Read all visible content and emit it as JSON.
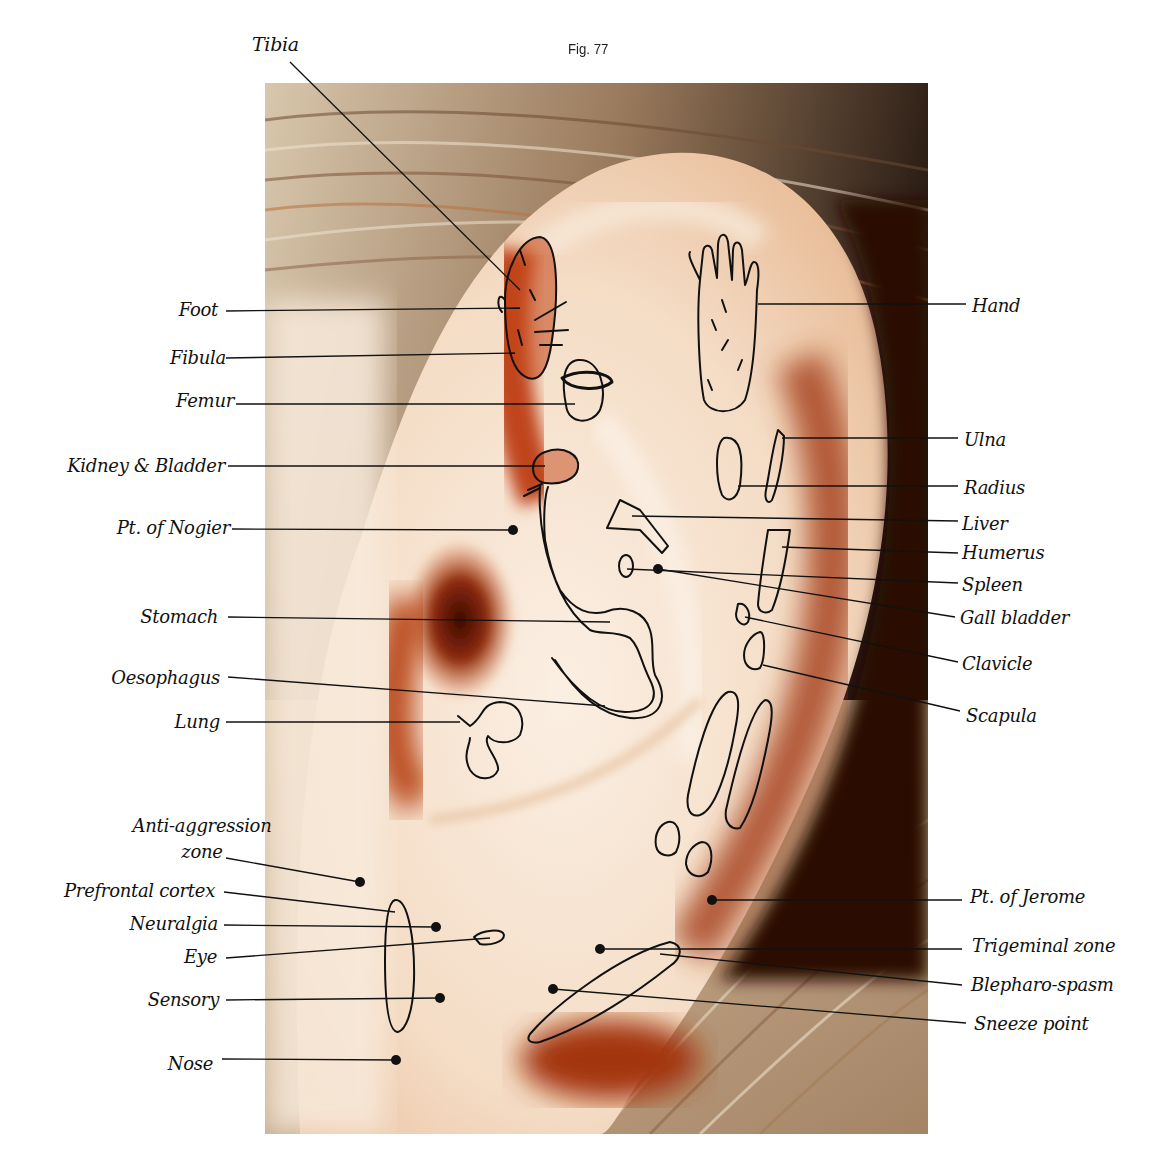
{
  "figure": {
    "caption": "Fig. 77",
    "title_label": "Tibia",
    "photo": {
      "x": 265,
      "y": 83,
      "width": 663,
      "height": 1051
    },
    "colors": {
      "skin_light": "#f6e6d6",
      "skin_mid": "#eec9a8",
      "red_shadow": "#b53a12",
      "dark_shadow": "#4a0f05",
      "hair_light": "#c9b79e",
      "hair_dark": "#2a1a12",
      "ink": "#111111"
    }
  },
  "labels_left": [
    {
      "id": "foot",
      "text": "Foot",
      "x": 218,
      "y": 300,
      "line": [
        226,
        311,
        520,
        308
      ],
      "dot": false
    },
    {
      "id": "fibula",
      "text": "Fibula",
      "x": 226,
      "y": 348,
      "line": [
        226,
        358,
        515,
        353
      ],
      "dot": false
    },
    {
      "id": "femur",
      "text": "Femur",
      "x": 234,
      "y": 391,
      "line": [
        236,
        404,
        575,
        404
      ],
      "dot": false
    },
    {
      "id": "kidney-bladder",
      "text": "Kidney & Bladder",
      "x": 225,
      "y": 456,
      "line": [
        228,
        466,
        545,
        466
      ],
      "dot": false
    },
    {
      "id": "pt-of-nogier",
      "text": "Pt. of Nogier",
      "x": 230,
      "y": 518,
      "line": [
        232,
        529,
        513,
        530
      ],
      "dot": true
    },
    {
      "id": "stomach",
      "text": "Stomach",
      "x": 218,
      "y": 607,
      "line": [
        228,
        617,
        610,
        622
      ],
      "dot": false
    },
    {
      "id": "oesophagus",
      "text": "Oesophagus",
      "x": 220,
      "y": 668,
      "line": [
        228,
        677,
        605,
        706
      ],
      "dot": false
    },
    {
      "id": "lung",
      "text": "Lung",
      "x": 220,
      "y": 712,
      "line": [
        226,
        722,
        460,
        722
      ],
      "dot": false
    },
    {
      "id": "anti-aggression-zone",
      "text": "Anti-aggression zone",
      "x": 132,
      "y": 816,
      "line": [
        226,
        858,
        360,
        882
      ],
      "dot": true,
      "multiline": [
        "Anti-aggression",
        "zone"
      ]
    },
    {
      "id": "prefrontal-cortex",
      "text": "Prefrontal cortex",
      "x": 215,
      "y": 881,
      "line": [
        224,
        892,
        395,
        912
      ],
      "dot": false
    },
    {
      "id": "neuralgia",
      "text": "Neuralgia",
      "x": 218,
      "y": 914,
      "line": [
        224,
        925,
        436,
        927
      ],
      "dot": true
    },
    {
      "id": "eye",
      "text": "Eye",
      "x": 217,
      "y": 947,
      "line": [
        226,
        958,
        490,
        938
      ],
      "dot": false
    },
    {
      "id": "sensory",
      "text": "Sensory",
      "x": 219,
      "y": 990,
      "line": [
        226,
        1000,
        440,
        998
      ],
      "dot": true
    },
    {
      "id": "nose",
      "text": "Nose",
      "x": 213,
      "y": 1054,
      "line": [
        222,
        1059,
        396,
        1060
      ],
      "dot": true
    }
  ],
  "labels_right": [
    {
      "id": "hand",
      "text": "Hand",
      "x": 972,
      "y": 296,
      "line": [
        758,
        304,
        966,
        304
      ],
      "dot": false
    },
    {
      "id": "ulna",
      "text": "Ulna",
      "x": 964,
      "y": 430,
      "line": [
        782,
        438,
        958,
        438
      ],
      "dot": false
    },
    {
      "id": "radius",
      "text": "Radius",
      "x": 964,
      "y": 478,
      "line": [
        738,
        486,
        958,
        486
      ],
      "dot": false
    },
    {
      "id": "liver",
      "text": "Liver",
      "x": 962,
      "y": 514,
      "line": [
        632,
        516,
        958,
        521
      ],
      "dot": false
    },
    {
      "id": "humerus",
      "text": "Humerus",
      "x": 962,
      "y": 543,
      "line": [
        782,
        547,
        958,
        553
      ],
      "dot": false
    },
    {
      "id": "spleen",
      "text": "Spleen",
      "x": 962,
      "y": 575,
      "line": [
        627,
        569,
        958,
        583
      ],
      "dot": false
    },
    {
      "id": "gall-bladder",
      "text": "Gall bladder",
      "x": 960,
      "y": 608,
      "line": [
        658,
        569,
        955,
        617
      ],
      "dot": true
    },
    {
      "id": "clavicle",
      "text": "Clavicle",
      "x": 962,
      "y": 654,
      "line": [
        745,
        617,
        958,
        662
      ],
      "dot": false
    },
    {
      "id": "scapula",
      "text": "Scapula",
      "x": 966,
      "y": 706,
      "line": [
        763,
        665,
        960,
        711
      ],
      "dot": false
    },
    {
      "id": "pt-of-jerome",
      "text": "Pt. of Jerome",
      "x": 970,
      "y": 887,
      "line": [
        712,
        900,
        962,
        900
      ],
      "dot": true
    },
    {
      "id": "trigeminal-zone",
      "text": "Trigeminal zone",
      "x": 972,
      "y": 936,
      "line": [
        600,
        949,
        962,
        949
      ],
      "dot": true
    },
    {
      "id": "blepharo-spasm",
      "text": "Blepharo-spasm",
      "x": 971,
      "y": 975,
      "line": [
        660,
        954,
        962,
        985
      ],
      "dot": false
    },
    {
      "id": "sneeze-point",
      "text": "Sneeze point",
      "x": 974,
      "y": 1014,
      "line": [
        553,
        989,
        966,
        1023
      ],
      "dot": true
    }
  ],
  "tibia_line": [
    290,
    62,
    520,
    290
  ]
}
